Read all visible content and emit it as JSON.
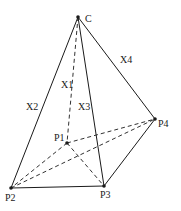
{
  "diagram": {
    "type": "pyramid",
    "vertices": {
      "C": {
        "label": "C",
        "x": 78,
        "y": 17,
        "lx": 85,
        "ly": 22
      },
      "P1": {
        "label": "P1",
        "x": 67,
        "y": 143,
        "lx": 54,
        "ly": 141
      },
      "P2": {
        "label": "P2",
        "x": 11,
        "y": 188,
        "lx": 5,
        "ly": 201
      },
      "P3": {
        "label": "P3",
        "x": 104,
        "y": 186,
        "lx": 100,
        "ly": 198
      },
      "P4": {
        "label": "P4",
        "x": 155,
        "y": 119,
        "lx": 158,
        "ly": 127
      }
    },
    "edges": [
      {
        "from": "C",
        "to": "P2",
        "style": "solid",
        "label": "X2"
      },
      {
        "from": "C",
        "to": "P3",
        "style": "solid",
        "label": "X3"
      },
      {
        "from": "C",
        "to": "P4",
        "style": "solid",
        "label": "X4"
      },
      {
        "from": "C",
        "to": "P1",
        "style": "dashed",
        "label": "X1"
      },
      {
        "from": "P2",
        "to": "P3",
        "style": "solid"
      },
      {
        "from": "P3",
        "to": "P4",
        "style": "solid"
      },
      {
        "from": "P1",
        "to": "P4",
        "style": "dashed"
      },
      {
        "from": "P1",
        "to": "P2",
        "style": "dashed"
      },
      {
        "from": "P1",
        "to": "P3",
        "style": "dashed"
      },
      {
        "from": "P2",
        "to": "P4",
        "style": "dashed"
      }
    ],
    "edge_labels": {
      "X1": {
        "text": "X1",
        "x": 61,
        "y": 88
      },
      "X2": {
        "text": "X2",
        "x": 26,
        "y": 110
      },
      "X3": {
        "text": "X3",
        "x": 78,
        "y": 110
      },
      "X4": {
        "text": "X4",
        "x": 120,
        "y": 63
      }
    }
  }
}
